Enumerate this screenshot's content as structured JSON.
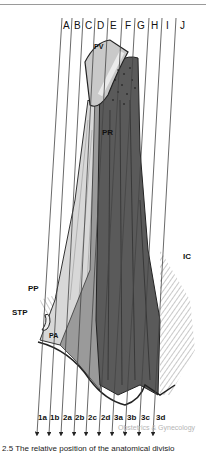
{
  "figure": {
    "top_labels": [
      "A",
      "B",
      "C",
      "D",
      "E",
      "F",
      "G",
      "H",
      "I",
      "J"
    ],
    "bottom_labels": [
      "1a",
      "1b",
      "2a",
      "2b",
      "2c",
      "2d",
      "3a",
      "3b",
      "3c",
      "3d"
    ],
    "structure_labels": {
      "pv": "PV",
      "pr": "PR",
      "ic": "IC",
      "pp": "PP",
      "stp": "STP",
      "pa": "PA"
    },
    "watermark": "Obstetrics & Gynecology",
    "caption_partial": "2.5  The relative position of the anatomical divisio"
  },
  "colors": {
    "line": "#4a4a4a",
    "dark_muscle": "#555555",
    "mid_muscle": "#8a8a8a",
    "light_muscle": "#d4d4d4",
    "pv_fill": "#c9c9c9"
  }
}
